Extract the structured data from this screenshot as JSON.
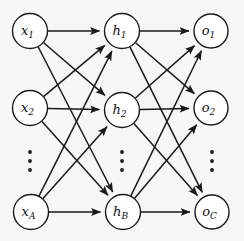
{
  "figure": {
    "type": "diagram",
    "background_color": "#f7f7f5",
    "stroke_color": "#1a1a1a",
    "node_fill_color": "#ffffff",
    "width": 244,
    "height": 241
  },
  "layers": [
    {
      "id": "input",
      "name": "input-layer",
      "x": 30,
      "node_count_symbol": "A",
      "nodes": [
        {
          "id": "x1",
          "base": "x",
          "sub": "1",
          "label": "x1",
          "cx": 30,
          "cy": 31,
          "r": 17.5
        },
        {
          "id": "x2",
          "base": "x",
          "sub": "2",
          "label": "x2",
          "cx": 30,
          "cy": 108,
          "r": 17.5
        },
        {
          "id": "xA",
          "base": "x",
          "sub": "A",
          "label": "xA",
          "cx": 31,
          "cy": 212,
          "r": 17.5
        }
      ],
      "ellipsis": {
        "cx": 30,
        "dots": [
          152,
          161,
          170
        ]
      }
    },
    {
      "id": "hidden",
      "name": "hidden-layer",
      "x": 122,
      "node_count_symbol": "B",
      "nodes": [
        {
          "id": "h1",
          "base": "h",
          "sub": "1",
          "label": "h1",
          "cx": 122,
          "cy": 31,
          "r": 17.5
        },
        {
          "id": "h2",
          "base": "h",
          "sub": "2",
          "label": "h2",
          "cx": 122,
          "cy": 110,
          "r": 17.5
        },
        {
          "id": "hB",
          "base": "h",
          "sub": "B",
          "label": "hB",
          "cx": 123,
          "cy": 212,
          "r": 17.5
        }
      ],
      "ellipsis": {
        "cx": 122,
        "dots": [
          152,
          161,
          170
        ]
      }
    },
    {
      "id": "output",
      "name": "output-layer",
      "x": 212,
      "node_count_symbol": "C",
      "nodes": [
        {
          "id": "o1",
          "base": "o",
          "sub": "1",
          "label": "o1",
          "cx": 211,
          "cy": 31,
          "r": 17
        },
        {
          "id": "o2",
          "base": "o",
          "sub": "2",
          "label": "o2",
          "cx": 211,
          "cy": 108,
          "r": 17
        },
        {
          "id": "oC",
          "base": "o",
          "sub": "C",
          "label": "oC",
          "cx": 212,
          "cy": 212,
          "r": 17
        }
      ],
      "ellipsis": {
        "cx": 212,
        "dots": [
          152,
          161,
          170
        ]
      }
    }
  ],
  "edges": [
    {
      "from": "x1",
      "to": "h1",
      "directed": true
    },
    {
      "from": "x1",
      "to": "h2",
      "directed": true
    },
    {
      "from": "x1",
      "to": "hB",
      "directed": true
    },
    {
      "from": "x2",
      "to": "h1",
      "directed": true
    },
    {
      "from": "x2",
      "to": "h2",
      "directed": true
    },
    {
      "from": "x2",
      "to": "hB",
      "directed": true
    },
    {
      "from": "xA",
      "to": "h1",
      "directed": true
    },
    {
      "from": "xA",
      "to": "h2",
      "directed": true
    },
    {
      "from": "xA",
      "to": "hB",
      "directed": true
    },
    {
      "from": "h1",
      "to": "o1",
      "directed": true
    },
    {
      "from": "h1",
      "to": "o2",
      "directed": true
    },
    {
      "from": "h1",
      "to": "oC",
      "directed": true
    },
    {
      "from": "h2",
      "to": "o1",
      "directed": true
    },
    {
      "from": "h2",
      "to": "o2",
      "directed": true
    },
    {
      "from": "h2",
      "to": "oC",
      "directed": true
    },
    {
      "from": "hB",
      "to": "o1",
      "directed": true
    },
    {
      "from": "hB",
      "to": "o2",
      "directed": true
    },
    {
      "from": "hB",
      "to": "oC",
      "directed": true
    }
  ]
}
